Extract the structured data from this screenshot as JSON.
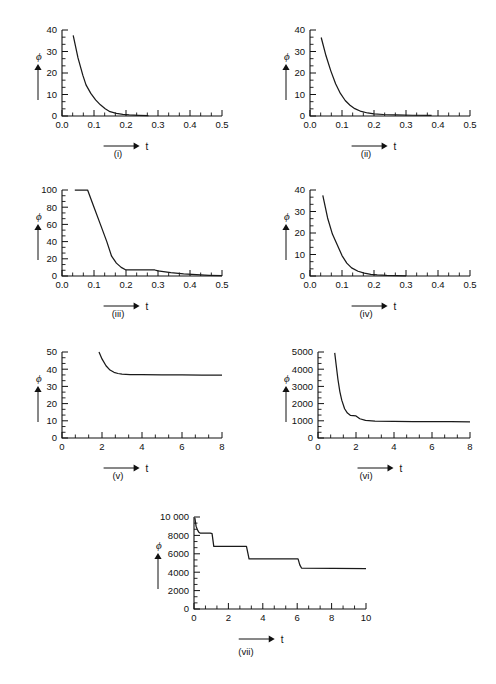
{
  "figure": {
    "background": "#ffffff",
    "ink": "#111111",
    "y_axis_symbol": "ϕ",
    "x_axis_symbol": "t"
  },
  "chart_data": [
    {
      "id": "i",
      "type": "line",
      "title": "",
      "caption": "(i)",
      "xlabel": "t",
      "ylabel": "ϕ",
      "xlim": [
        0.0,
        0.5
      ],
      "ylim": [
        0,
        40
      ],
      "xticks": [
        0.0,
        0.1,
        0.2,
        0.3,
        0.4,
        0.5
      ],
      "xtick_labels": [
        "0.0",
        "0.1",
        "0.2",
        "0.3",
        "0.4",
        "0.5"
      ],
      "yticks": [
        0,
        10,
        20,
        30,
        40
      ],
      "ytick_labels": [
        "0",
        "10",
        "20",
        "30",
        "40"
      ],
      "grid": false,
      "legend": "none",
      "x": [
        0.035,
        0.05,
        0.065,
        0.075,
        0.09,
        0.105,
        0.12,
        0.135,
        0.15,
        0.17,
        0.19,
        0.21,
        0.24,
        0.27
      ],
      "y": [
        37.5,
        27.0,
        19.0,
        14.5,
        10.5,
        7.5,
        5.2,
        3.4,
        2.0,
        1.2,
        0.8,
        0.5,
        0.3,
        0.15
      ]
    },
    {
      "id": "ii",
      "type": "line",
      "title": "",
      "caption": "(ii)",
      "xlabel": "t",
      "ylabel": "ϕ",
      "xlim": [
        0.0,
        0.5
      ],
      "ylim": [
        0,
        40
      ],
      "xticks": [
        0.0,
        0.1,
        0.2,
        0.3,
        0.4,
        0.5
      ],
      "xtick_labels": [
        "0.0",
        "0.1",
        "0.2",
        "0.3",
        "0.4",
        "0.5"
      ],
      "yticks": [
        0,
        10,
        20,
        30,
        40
      ],
      "ytick_labels": [
        "0",
        "10",
        "20",
        "30",
        "40"
      ],
      "grid": false,
      "legend": "none",
      "x": [
        0.035,
        0.05,
        0.065,
        0.08,
        0.095,
        0.11,
        0.125,
        0.14,
        0.16,
        0.18,
        0.2,
        0.23,
        0.27,
        0.32,
        0.38
      ],
      "y": [
        36.5,
        28.0,
        21.0,
        15.0,
        10.5,
        7.2,
        5.0,
        3.4,
        2.1,
        1.4,
        1.0,
        0.7,
        0.5,
        0.35,
        0.25
      ]
    },
    {
      "id": "iii",
      "type": "line",
      "title": "",
      "caption": "(iii)",
      "xlabel": "t",
      "ylabel": "ϕ",
      "xlim": [
        0.0,
        0.5
      ],
      "ylim": [
        0,
        100
      ],
      "xticks": [
        0.0,
        0.1,
        0.2,
        0.3,
        0.4,
        0.5
      ],
      "xtick_labels": [
        "0.0",
        "0.1",
        "0.2",
        "0.3",
        "0.4",
        "0.5"
      ],
      "yticks": [
        0,
        20,
        40,
        60,
        80,
        100
      ],
      "ytick_labels": [
        "0",
        "20",
        "40",
        "60",
        "80",
        "100"
      ],
      "grid": false,
      "legend": "none",
      "x": [
        0.04,
        0.08,
        0.1,
        0.12,
        0.14,
        0.155,
        0.17,
        0.185,
        0.2,
        0.25,
        0.29,
        0.3,
        0.34,
        0.38,
        0.42,
        0.46,
        0.5
      ],
      "y": [
        100,
        100,
        80,
        60,
        40,
        23,
        15,
        10,
        7,
        7,
        7,
        6,
        4,
        2.5,
        1.5,
        0.8,
        0.3
      ]
    },
    {
      "id": "iv",
      "type": "line",
      "title": "",
      "caption": "(iv)",
      "xlabel": "t",
      "ylabel": "ϕ",
      "xlim": [
        0.0,
        0.5
      ],
      "ylim": [
        0,
        40
      ],
      "xticks": [
        0.0,
        0.1,
        0.2,
        0.3,
        0.4,
        0.5
      ],
      "xtick_labels": [
        "0.0",
        "0.1",
        "0.2",
        "0.3",
        "0.4",
        "0.5"
      ],
      "yticks": [
        0,
        10,
        20,
        30,
        40
      ],
      "ytick_labels": [
        "0",
        "10",
        "20",
        "30",
        "40"
      ],
      "grid": false,
      "legend": "none",
      "x": [
        0.04,
        0.055,
        0.07,
        0.085,
        0.1,
        0.115,
        0.13,
        0.15,
        0.17,
        0.19,
        0.21,
        0.24,
        0.27,
        0.3
      ],
      "y": [
        37.5,
        27.0,
        19.5,
        14.5,
        9.5,
        6.0,
        3.8,
        2.2,
        1.3,
        0.8,
        0.5,
        0.3,
        0.2,
        0.1
      ]
    },
    {
      "id": "v",
      "type": "line",
      "title": "",
      "caption": "(v)",
      "xlabel": "t",
      "ylabel": "ϕ",
      "xlim": [
        0,
        8
      ],
      "ylim": [
        0,
        50
      ],
      "xticks": [
        0,
        2,
        4,
        6,
        8
      ],
      "xtick_labels": [
        "0",
        "2",
        "4",
        "6",
        "8"
      ],
      "yticks": [
        0,
        10,
        20,
        30,
        40,
        50
      ],
      "ytick_labels": [
        "0",
        "10",
        "20",
        "30",
        "40",
        "50"
      ],
      "grid": false,
      "legend": "none",
      "x": [
        1.85,
        2.0,
        2.2,
        2.4,
        2.6,
        2.8,
        3.0,
        3.4,
        4.0,
        5.0,
        6.0,
        7.0,
        8.0
      ],
      "y": [
        50.0,
        46.0,
        42.0,
        39.5,
        38.2,
        37.5,
        37.1,
        36.9,
        36.8,
        36.7,
        36.7,
        36.6,
        36.6
      ]
    },
    {
      "id": "vi",
      "type": "line",
      "title": "",
      "caption": "(vi)",
      "xlabel": "t",
      "ylabel": "ϕ",
      "xlim": [
        0,
        8
      ],
      "ylim": [
        0,
        5000
      ],
      "xticks": [
        0,
        2,
        4,
        6,
        8
      ],
      "xtick_labels": [
        "0",
        "2",
        "4",
        "6",
        "8"
      ],
      "yticks": [
        0,
        1000,
        2000,
        3000,
        4000,
        5000
      ],
      "ytick_labels": [
        "0",
        "1000",
        "2000",
        "3000",
        "4000",
        "5000"
      ],
      "grid": false,
      "legend": "none",
      "x": [
        0.88,
        0.95,
        1.05,
        1.15,
        1.25,
        1.4,
        1.55,
        1.7,
        1.85,
        2.0,
        2.2,
        2.5,
        3.0,
        4.0,
        5.0,
        6.0,
        7.0,
        8.0
      ],
      "y": [
        4950,
        4300,
        3400,
        2700,
        2200,
        1700,
        1450,
        1320,
        1300,
        1280,
        1120,
        1020,
        980,
        960,
        955,
        950,
        950,
        945
      ]
    },
    {
      "id": "vii",
      "type": "line",
      "title": "",
      "caption": "(vii)",
      "xlabel": "t",
      "ylabel": "ϕ",
      "xlim": [
        0,
        10
      ],
      "ylim": [
        0,
        10000
      ],
      "xticks": [
        0,
        2,
        4,
        6,
        8,
        10
      ],
      "xtick_labels": [
        "0",
        "2",
        "4",
        "6",
        "8",
        "10"
      ],
      "yticks": [
        0,
        2000,
        4000,
        6000,
        8000,
        10000
      ],
      "ytick_labels": [
        "0",
        "2000",
        "4000",
        "6000",
        "8000",
        "10 000"
      ],
      "grid": false,
      "legend": "none",
      "x": [
        0.05,
        0.12,
        0.2,
        0.28,
        0.35,
        0.95,
        1.05,
        1.15,
        3.05,
        3.15,
        3.2,
        6.05,
        6.15,
        6.25,
        10.0
      ],
      "y": [
        9900,
        9000,
        8600,
        8350,
        8250,
        8250,
        8200,
        6800,
        6800,
        5900,
        5450,
        5450,
        4800,
        4450,
        4400
      ]
    }
  ]
}
